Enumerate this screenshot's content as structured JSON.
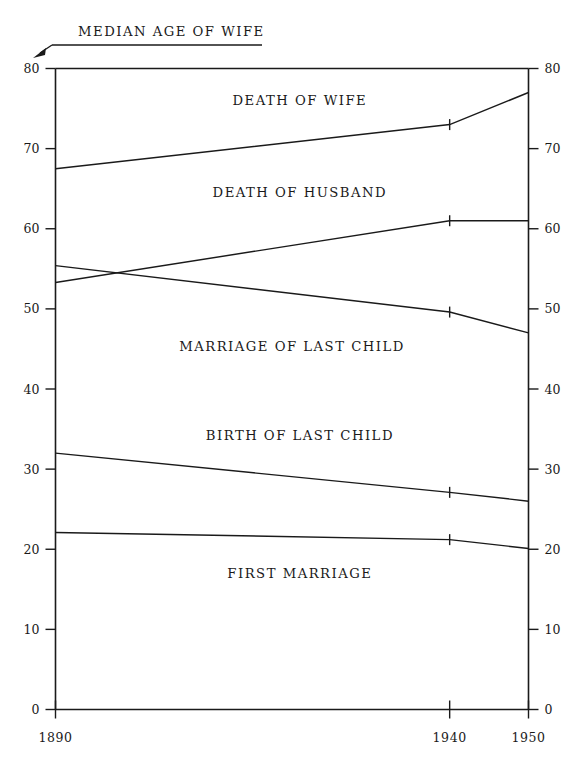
{
  "chart_data": {
    "type": "line",
    "title": "MEDIAN AGE OF WIFE",
    "xlabel": "",
    "ylabel": "",
    "x": [
      1890,
      1940,
      1950
    ],
    "xlim": [
      1890,
      1950
    ],
    "ylim": [
      0,
      80
    ],
    "x_ticks": [
      "1890",
      "1940",
      "1950"
    ],
    "y_ticks": [
      "0",
      "10",
      "20",
      "30",
      "40",
      "50",
      "60",
      "70",
      "80"
    ],
    "y_tick_values": [
      0,
      10,
      20,
      30,
      40,
      50,
      60,
      70,
      80
    ],
    "grid": false,
    "legend": "inline-labels",
    "dual_y_axis": true,
    "series": [
      {
        "name": "DEATH OF WIFE",
        "values": [
          67.5,
          73.0,
          77.0
        ],
        "label_x": 1921,
        "label_y": 75.5
      },
      {
        "name": "DEATH OF HUSBAND",
        "values": [
          53.3,
          61.0,
          61.0
        ],
        "label_x": 1921,
        "label_y": 64.0
      },
      {
        "name": "MARRIAGE OF LAST CHILD",
        "values": [
          55.4,
          49.6,
          47.0
        ],
        "label_x": 1920,
        "label_y": 44.8
      },
      {
        "name": "BIRTH OF LAST CHILD",
        "values": [
          32.0,
          27.1,
          26.0
        ],
        "label_x": 1921,
        "label_y": 33.6
      },
      {
        "name": "FIRST MARRIAGE",
        "values": [
          22.1,
          21.2,
          20.1
        ],
        "label_x": 1921,
        "label_y": 16.4
      }
    ]
  },
  "colors": {
    "ink": "#1a1a1a",
    "background": "#ffffff"
  }
}
